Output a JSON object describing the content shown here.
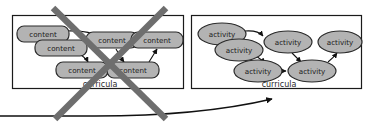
{
  "diagram": {
    "colors": {
      "node_fill": "#b3b3b3",
      "node_stroke": "#2b2b2b",
      "panel_stroke": "#1a1a1a",
      "panel_fill": "#ffffff",
      "edge_stroke": "#111111",
      "cross_out_stroke": "#6e6e6e",
      "label_text": "#2a2a2a",
      "background": "#ffffff"
    },
    "left_panel": {
      "name": "content-curricula-panel",
      "label": "curricula",
      "crossed_out": true,
      "node_shape": "rounded-rectangle",
      "nodes": [
        {
          "id": "c1",
          "label": "content",
          "cx": 43,
          "cy": 34,
          "rx": 26,
          "ry": 8
        },
        {
          "id": "c2",
          "label": "content",
          "cx": 61,
          "cy": 48,
          "rx": 26,
          "ry": 8
        },
        {
          "id": "c3",
          "label": "content",
          "cx": 82,
          "cy": 70,
          "rx": 26,
          "ry": 8
        },
        {
          "id": "c4",
          "label": "content",
          "cx": 112,
          "cy": 40,
          "rx": 26,
          "ry": 8
        },
        {
          "id": "c5",
          "label": "content",
          "cx": 133,
          "cy": 70,
          "rx": 26,
          "ry": 8
        },
        {
          "id": "c6",
          "label": "content",
          "cx": 157,
          "cy": 40,
          "rx": 26,
          "ry": 8
        }
      ],
      "edges": [
        {
          "from": "c1",
          "to": "c4"
        },
        {
          "from": "c2",
          "to": "c3"
        },
        {
          "from": "c3",
          "to": "c5"
        },
        {
          "from": "c4",
          "to": "c5"
        },
        {
          "from": "c5",
          "to": "c6"
        }
      ]
    },
    "right_panel": {
      "name": "activity-curricula-panel",
      "label": "curricula",
      "crossed_out": false,
      "node_shape": "ellipse",
      "nodes": [
        {
          "id": "a1",
          "label": "activity",
          "cx": 222,
          "cy": 34,
          "rx": 24,
          "ry": 11
        },
        {
          "id": "a2",
          "label": "activity",
          "cx": 239,
          "cy": 50,
          "rx": 24,
          "ry": 11
        },
        {
          "id": "a3",
          "label": "activity",
          "cx": 258,
          "cy": 71,
          "rx": 24,
          "ry": 11
        },
        {
          "id": "a4",
          "label": "activity",
          "cx": 288,
          "cy": 42,
          "rx": 24,
          "ry": 11
        },
        {
          "id": "a5",
          "label": "activity",
          "cx": 312,
          "cy": 71,
          "rx": 24,
          "ry": 11
        },
        {
          "id": "a6",
          "label": "activity",
          "cx": 340,
          "cy": 42,
          "rx": 24,
          "ry": 11
        }
      ],
      "edges": [
        {
          "from": "a1",
          "to": "a4"
        },
        {
          "from": "a2",
          "to": "a3"
        },
        {
          "from": "a3",
          "to": "a5"
        },
        {
          "from": "a4",
          "to": "a5"
        },
        {
          "from": "a5",
          "to": "a6"
        }
      ]
    },
    "transition_arrow": {
      "name": "curricula-transition-arrow",
      "from_panel": "left_panel",
      "to_panel": "right_panel"
    }
  }
}
